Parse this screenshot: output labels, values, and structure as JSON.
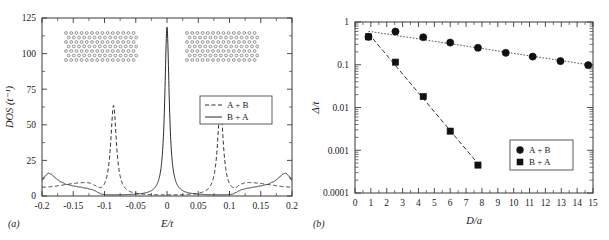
{
  "figure": {
    "panel_a_tag": "(a)",
    "panel_b_tag": "(b)"
  },
  "chart_data": [
    {
      "id": "panel-a",
      "type": "line",
      "title": "",
      "xlabel": "E/t",
      "ylabel": "DOS (t⁻¹)",
      "xlim": [
        -0.2,
        0.2
      ],
      "ylim": [
        0,
        125
      ],
      "xticks": [
        -0.2,
        -0.15,
        -0.1,
        -0.05,
        0,
        0.05,
        0.1,
        0.15,
        0.2
      ],
      "xtick_labels": [
        "-0.2",
        "-0.15",
        "-0.1",
        "-0.05",
        "0",
        "0.05",
        "0.1",
        "0.15",
        "0.2"
      ],
      "yticks": [
        0,
        25,
        50,
        75,
        100,
        125
      ],
      "ytick_labels": [
        "0",
        "25",
        "50",
        "75",
        "100",
        "125"
      ],
      "grid": false,
      "legend_position": "center-right",
      "legend": [
        "A + B",
        "B + A"
      ],
      "series": [
        {
          "name": "A + B",
          "style": "dashed",
          "peaks": [
            {
              "center": -0.0855,
              "height": 63,
              "width": 0.0055
            },
            {
              "center": 0.0855,
              "height": 63,
              "width": 0.0055
            }
          ],
          "baseline": [
            {
              "x": -0.2,
              "y": 6.0
            },
            {
              "x": -0.19,
              "y": 6.2
            },
            {
              "x": -0.18,
              "y": 6.6
            },
            {
              "x": -0.17,
              "y": 7.2
            },
            {
              "x": -0.16,
              "y": 7.8
            },
            {
              "x": -0.15,
              "y": 8.3
            },
            {
              "x": -0.14,
              "y": 8.6
            },
            {
              "x": -0.13,
              "y": 8.5
            },
            {
              "x": -0.125,
              "y": 8.0
            },
            {
              "x": -0.12,
              "y": 7.0
            },
            {
              "x": -0.115,
              "y": 5.2
            },
            {
              "x": -0.11,
              "y": 3.0
            },
            {
              "x": -0.105,
              "y": 1.4
            },
            {
              "x": -0.1,
              "y": 0.7
            },
            {
              "x": -0.095,
              "y": 0.5
            },
            {
              "x": -0.06,
              "y": 0.4
            },
            {
              "x": -0.03,
              "y": 0.3
            },
            {
              "x": 0.0,
              "y": 0.3
            },
            {
              "x": 0.03,
              "y": 0.3
            },
            {
              "x": 0.06,
              "y": 0.4
            },
            {
              "x": 0.095,
              "y": 0.5
            },
            {
              "x": 0.1,
              "y": 0.7
            },
            {
              "x": 0.105,
              "y": 1.4
            },
            {
              "x": 0.11,
              "y": 3.0
            },
            {
              "x": 0.115,
              "y": 5.2
            },
            {
              "x": 0.12,
              "y": 7.0
            },
            {
              "x": 0.125,
              "y": 8.0
            },
            {
              "x": 0.13,
              "y": 8.5
            },
            {
              "x": 0.14,
              "y": 8.6
            },
            {
              "x": 0.15,
              "y": 8.3
            },
            {
              "x": 0.16,
              "y": 7.8
            },
            {
              "x": 0.17,
              "y": 7.2
            },
            {
              "x": 0.18,
              "y": 6.6
            },
            {
              "x": 0.19,
              "y": 6.2
            },
            {
              "x": 0.2,
              "y": 6.0
            }
          ]
        },
        {
          "name": "B + A",
          "style": "solid",
          "peaks": [
            {
              "center": 0.0,
              "height": 118,
              "width": 0.0042
            }
          ],
          "baseline": [
            {
              "x": -0.2,
              "y": 11.0
            },
            {
              "x": -0.195,
              "y": 14.0
            },
            {
              "x": -0.19,
              "y": 16.0
            },
            {
              "x": -0.185,
              "y": 15.2
            },
            {
              "x": -0.18,
              "y": 13.2
            },
            {
              "x": -0.175,
              "y": 11.3
            },
            {
              "x": -0.17,
              "y": 9.8
            },
            {
              "x": -0.16,
              "y": 8.0
            },
            {
              "x": -0.15,
              "y": 7.0
            },
            {
              "x": -0.14,
              "y": 6.2
            },
            {
              "x": -0.13,
              "y": 5.4
            },
            {
              "x": -0.12,
              "y": 4.4
            },
            {
              "x": -0.115,
              "y": 3.5
            },
            {
              "x": -0.11,
              "y": 2.2
            },
            {
              "x": -0.105,
              "y": 1.2
            },
            {
              "x": -0.1,
              "y": 0.8
            },
            {
              "x": -0.09,
              "y": 0.6
            },
            {
              "x": -0.06,
              "y": 0.5
            },
            {
              "x": -0.03,
              "y": 0.5
            },
            {
              "x": -0.015,
              "y": 0.6
            },
            {
              "x": 0.015,
              "y": 0.6
            },
            {
              "x": 0.03,
              "y": 0.5
            },
            {
              "x": 0.06,
              "y": 0.5
            },
            {
              "x": 0.09,
              "y": 0.6
            },
            {
              "x": 0.1,
              "y": 0.8
            },
            {
              "x": 0.105,
              "y": 1.2
            },
            {
              "x": 0.11,
              "y": 2.2
            },
            {
              "x": 0.115,
              "y": 3.5
            },
            {
              "x": 0.12,
              "y": 4.4
            },
            {
              "x": 0.13,
              "y": 5.4
            },
            {
              "x": 0.14,
              "y": 6.2
            },
            {
              "x": 0.15,
              "y": 7.0
            },
            {
              "x": 0.16,
              "y": 8.0
            },
            {
              "x": 0.17,
              "y": 9.8
            },
            {
              "x": 0.175,
              "y": 11.3
            },
            {
              "x": 0.18,
              "y": 13.2
            },
            {
              "x": 0.185,
              "y": 15.2
            },
            {
              "x": 0.19,
              "y": 16.0
            },
            {
              "x": 0.195,
              "y": 14.0
            },
            {
              "x": 0.2,
              "y": 11.0
            }
          ]
        }
      ],
      "insets": [
        {
          "name": "honeycomb-lattice-left",
          "cols": 13,
          "rows": 6
        },
        {
          "name": "honeycomb-lattice-right",
          "cols": 13,
          "rows": 6
        }
      ]
    },
    {
      "id": "panel-b",
      "type": "scatter",
      "title": "",
      "xlabel": "D/a",
      "ylabel": "Δ/t",
      "yscale": "log",
      "xlim": [
        0,
        15
      ],
      "ylim": [
        0.0001,
        1
      ],
      "xticks": [
        0,
        1,
        2,
        3,
        4,
        5,
        6,
        7,
        8,
        9,
        10,
        11,
        12,
        13,
        14,
        15
      ],
      "xtick_labels": [
        "0",
        "1",
        "2",
        "3",
        "4",
        "5",
        "6",
        "7",
        "8",
        "9",
        "10",
        "11",
        "12",
        "13",
        "14",
        "15"
      ],
      "yticks": [
        1,
        0.1,
        0.01,
        0.001,
        0.0001
      ],
      "ytick_labels": [
        "1",
        "0.1",
        "0.01",
        "0.001",
        "0.0001"
      ],
      "grid": false,
      "legend_position": "bottom-right",
      "legend": [
        "A + B",
        "B + A"
      ],
      "series": [
        {
          "name": "A + B",
          "marker": "circle",
          "fitline": "dotted",
          "x": [
            0.85,
            2.55,
            4.3,
            6.0,
            7.75,
            9.5,
            11.2,
            12.95,
            14.7
          ],
          "y": [
            0.45,
            0.6,
            0.44,
            0.33,
            0.25,
            0.19,
            0.155,
            0.122,
            0.098
          ]
        },
        {
          "name": "B + A",
          "marker": "square",
          "fitline": "dashed",
          "x": [
            0.85,
            2.55,
            4.3,
            6.0,
            7.75
          ],
          "y": [
            0.45,
            0.115,
            0.018,
            0.0028,
            0.00045
          ]
        }
      ]
    }
  ]
}
